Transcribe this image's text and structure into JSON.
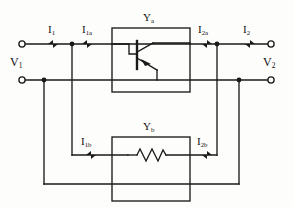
{
  "diagram": {
    "stroke_color": "#1a1a1a",
    "background_color": "#fdfdfb",
    "blocks": [
      {
        "id": "Ya",
        "base": "Y",
        "sub": "a",
        "contains": "bipolar-junction-transistor"
      },
      {
        "id": "Yb",
        "base": "Y",
        "sub": "b",
        "contains": "resistor"
      }
    ],
    "currents": [
      {
        "id": "I1",
        "base": "I",
        "sub": "1",
        "direction": "right"
      },
      {
        "id": "I1a",
        "base": "I",
        "sub": "1a",
        "direction": "right"
      },
      {
        "id": "I2a",
        "base": "I",
        "sub": "2a",
        "direction": "left"
      },
      {
        "id": "I2",
        "base": "I",
        "sub": "2",
        "direction": "left"
      },
      {
        "id": "I1b",
        "base": "I",
        "sub": "1b",
        "direction": "right"
      },
      {
        "id": "I2b",
        "base": "I",
        "sub": "2b",
        "direction": "left"
      }
    ],
    "voltages": [
      {
        "id": "V1",
        "base": "V",
        "sub": "1",
        "side": "left"
      },
      {
        "id": "V2",
        "base": "V",
        "sub": "2",
        "side": "right"
      }
    ],
    "terminals": [
      {
        "id": "t-left-top",
        "x": 22,
        "y": 44
      },
      {
        "id": "t-left-bottom",
        "x": 22,
        "y": 80
      },
      {
        "id": "t-right-top",
        "x": 271,
        "y": 44
      },
      {
        "id": "t-right-bottom",
        "x": 271,
        "y": 80
      }
    ]
  }
}
